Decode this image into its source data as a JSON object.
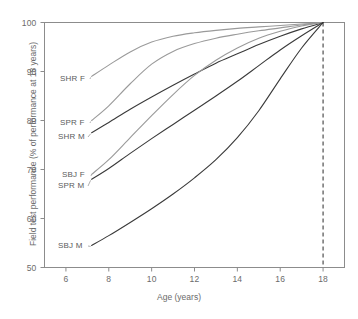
{
  "chart_data": {
    "type": "line",
    "title": "",
    "xlabel": "Age (years)",
    "ylabel": "Field test performance (% of performance at 18 years)",
    "xlim": [
      5,
      19
    ],
    "ylim": [
      50,
      100
    ],
    "xticks": [
      6,
      8,
      10,
      12,
      14,
      16,
      18
    ],
    "xtick_labels": [
      "6",
      "8",
      "10",
      "12",
      "14",
      "16",
      "18"
    ],
    "yticks": [
      50,
      60,
      70,
      80,
      90,
      100
    ],
    "ytick_labels": [
      "50",
      "60",
      "70",
      "80",
      "90",
      "100"
    ],
    "grid": false,
    "legend": "inline-labels-left",
    "annotations": [
      {
        "name": "reference-line-18-years",
        "type": "vertical-dashed-line",
        "x": 18
      }
    ],
    "series": [
      {
        "name": "SHR F",
        "color": "#9a9a9a",
        "label_value_at_start": 89,
        "x": [
          7.2,
          8,
          9,
          10,
          11,
          12,
          13,
          14,
          15,
          16,
          17,
          18
        ],
        "values": [
          89.0,
          91.3,
          94.0,
          96.0,
          97.2,
          97.9,
          98.4,
          98.8,
          99.1,
          99.4,
          99.7,
          100.0
        ]
      },
      {
        "name": "SPR F",
        "color": "#9a9a9a",
        "label_value_at_start": 80,
        "x": [
          7.2,
          8,
          9,
          10,
          11,
          12,
          13,
          14,
          15,
          16,
          17,
          18
        ],
        "values": [
          80.0,
          83.0,
          87.5,
          91.5,
          94.1,
          95.7,
          96.8,
          97.6,
          98.3,
          98.9,
          99.5,
          100.0
        ]
      },
      {
        "name": "SHR M",
        "color": "#3a3a3a",
        "label_value_at_start": 77.5,
        "x": [
          7.2,
          8,
          9,
          10,
          11,
          12,
          13,
          14,
          15,
          16,
          17,
          18
        ],
        "values": [
          77.5,
          79.6,
          82.3,
          84.8,
          87.2,
          89.5,
          91.7,
          93.6,
          95.5,
          97.2,
          98.7,
          100.0
        ]
      },
      {
        "name": "SBJ F",
        "color": "#9a9a9a",
        "label_value_at_start": 69,
        "x": [
          7.2,
          8,
          9,
          10,
          11,
          12,
          13,
          14,
          15,
          16,
          17,
          18
        ],
        "values": [
          69.0,
          72.0,
          76.5,
          81.0,
          85.3,
          89.2,
          92.3,
          94.8,
          96.8,
          98.2,
          99.3,
          100.0
        ]
      },
      {
        "name": "SPR M",
        "color": "#3a3a3a",
        "label_value_at_start": 68,
        "x": [
          7.2,
          8,
          9,
          10,
          11,
          12,
          13,
          14,
          15,
          16,
          17,
          18
        ],
        "values": [
          68.0,
          70.2,
          73.3,
          76.3,
          79.2,
          82.1,
          85.0,
          88.0,
          91.2,
          94.4,
          97.3,
          100.0
        ]
      },
      {
        "name": "SBJ M",
        "color": "#3a3a3a",
        "label_value_at_start": 54.5,
        "x": [
          7.2,
          8,
          9,
          10,
          11,
          12,
          13,
          14,
          15,
          16,
          17,
          18
        ],
        "values": [
          54.5,
          56.5,
          59.2,
          62.0,
          65.0,
          68.3,
          72.0,
          76.5,
          82.0,
          88.5,
          94.8,
          100.0
        ]
      }
    ]
  },
  "series_labels": [
    {
      "text": "SHR F",
      "x": 60,
      "y": 74
    },
    {
      "text": "SPR F",
      "x": 60,
      "y": 118
    },
    {
      "text": "SHR M",
      "x": 58,
      "y": 132
    },
    {
      "text": "SBJ F",
      "x": 62,
      "y": 170
    },
    {
      "text": "SPR M",
      "x": 58,
      "y": 181
    },
    {
      "text": "SBJ M",
      "x": 58,
      "y": 241
    }
  ],
  "axes": {
    "x_title": "Age (years)",
    "y_title": "Field test performance (% of performance at 18 years)"
  },
  "colors": {
    "gray_series": "#9a9a9a",
    "dark_series": "#3a3a3a",
    "axis": "#8c8c8c",
    "text": "#6b6b6b"
  }
}
